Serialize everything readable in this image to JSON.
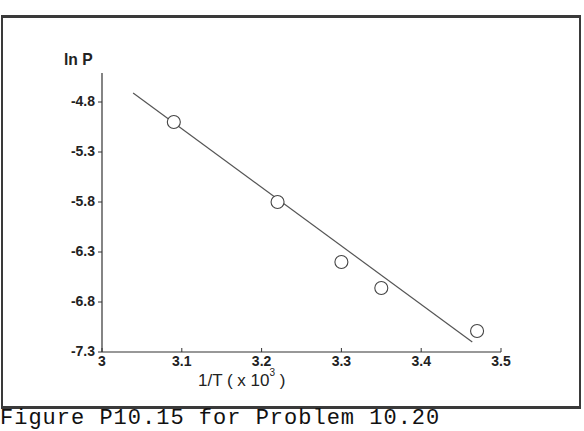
{
  "chart_data": {
    "type": "scatter",
    "title": "",
    "xlabel": "1/T ( x 10^3 )",
    "ylabel": "ln P",
    "xlim": [
      3.0,
      3.5
    ],
    "ylim": [
      -7.3,
      -4.6
    ],
    "x_ticks": [
      "3",
      "3.1",
      "3.2",
      "3.3",
      "3.4",
      "3.5"
    ],
    "y_ticks": [
      "-4.8",
      "-5.3",
      "-5.8",
      "-6.3",
      "-6.8",
      "-7.3"
    ],
    "grid": false,
    "legend": null,
    "series": [
      {
        "name": "data",
        "marker": "open-circle",
        "x": [
          3.09,
          3.22,
          3.3,
          3.35,
          3.47
        ],
        "y": [
          -5.0,
          -5.8,
          -6.4,
          -6.66,
          -7.09
        ]
      },
      {
        "name": "linear fit",
        "style": "line",
        "x": [
          3.039,
          3.464
        ],
        "y": [
          -4.71,
          -7.2
        ]
      }
    ]
  },
  "labels": {
    "ylabel": "ln P",
    "xlabel_main": "1/T ( x 10",
    "xlabel_exp": "3",
    "xlabel_close": " )",
    "caption": "Figure P10.15 for Problem 10.20"
  },
  "colors": {
    "line": "#555555",
    "marker": "#444444",
    "axis": "#333333"
  }
}
